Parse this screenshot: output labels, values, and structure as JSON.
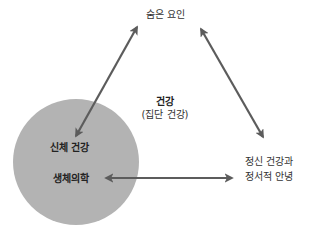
{
  "diagram": {
    "nodes": {
      "hidden_factors": {
        "label": "숨은 요인"
      },
      "center": {
        "title": "건강",
        "subtitle": "(집단 건강)"
      },
      "physical": {
        "line1": "신체 건강",
        "line2": "생체의학"
      },
      "mental": {
        "line1": "정신 건강과",
        "line2": "정서적 안녕"
      }
    },
    "edges": [
      {
        "from": "physical",
        "to": "hidden_factors",
        "type": "bidirectional"
      },
      {
        "from": "hidden_factors",
        "to": "mental",
        "type": "bidirectional"
      },
      {
        "from": "physical",
        "to": "mental",
        "type": "bidirectional"
      }
    ],
    "colors": {
      "circle": "#b3b3b3",
      "arrow": "#5c5c5c",
      "text": "#333333"
    }
  }
}
